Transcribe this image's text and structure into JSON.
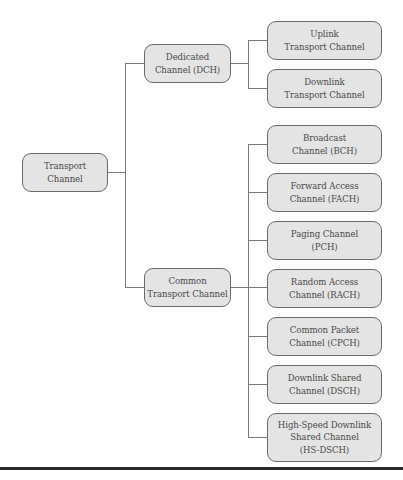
{
  "diagram": {
    "type": "tree",
    "root": {
      "id": "transport-channel",
      "label": "Transport\nChannel"
    },
    "branches": [
      {
        "id": "dedicated-channel",
        "label": "Dedicated\nChannel (DCH)",
        "children": [
          {
            "id": "uplink-transport-channel",
            "label": "Uplink\nTransport Channel"
          },
          {
            "id": "downlink-transport-channel",
            "label": "Downlink\nTransport Channel"
          }
        ]
      },
      {
        "id": "common-transport-channel",
        "label": "Common\nTransport Channel",
        "children": [
          {
            "id": "broadcast-channel",
            "label": "Broadcast\nChannel (BCH)"
          },
          {
            "id": "forward-access-channel",
            "label": "Forward Access\nChannel (FACH)"
          },
          {
            "id": "paging-channel",
            "label": "Paging Channel\n(PCH)"
          },
          {
            "id": "random-access-channel",
            "label": "Random Access\nChannel (RACH)"
          },
          {
            "id": "common-packet-channel",
            "label": "Common Packet\nChannel (CPCH)"
          },
          {
            "id": "downlink-shared-channel",
            "label": "Downlink Shared\nChannel (DSCH)"
          },
          {
            "id": "high-speed-downlink-shared-channel",
            "label": "High-Speed Downlink\nShared Channel\n(HS-DSCH)"
          }
        ]
      }
    ]
  },
  "colors": {
    "node_fill": "#e4e4e4",
    "node_border": "#6a6a6a",
    "connector": "#7a7a7a",
    "text": "#4a4a4a",
    "rule": "#2a2a2a"
  }
}
